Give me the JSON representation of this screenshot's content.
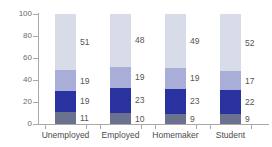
{
  "chart_data": {
    "type": "bar",
    "title": "",
    "subtitle": "",
    "xlabel": "",
    "ylabel": "",
    "ylim": [
      0,
      100
    ],
    "yticks": [
      0,
      20,
      40,
      60,
      80,
      100
    ],
    "grid": false,
    "legend": "none",
    "stacked": true,
    "stack_total": 100,
    "categories": [
      "Unemployed",
      "Employed",
      "Homemaker",
      "Student"
    ],
    "series": [
      {
        "name": "segment-1",
        "color": "#6a7290",
        "values": [
          11,
          10,
          9,
          9
        ]
      },
      {
        "name": "segment-2",
        "color": "#2a32a0",
        "values": [
          19,
          23,
          23,
          22
        ]
      },
      {
        "name": "segment-3",
        "color": "#a8aed8",
        "values": [
          19,
          19,
          19,
          17
        ]
      },
      {
        "name": "segment-4",
        "color": "#d8dce8",
        "values": [
          51,
          48,
          49,
          52
        ]
      }
    ]
  },
  "axis": {
    "tick_labels": [
      "0",
      "20",
      "40",
      "60",
      "80",
      "100"
    ]
  },
  "colors": {
    "segment_1": "#6a7290",
    "segment_2": "#2a32a0",
    "segment_3": "#a8aed8",
    "segment_4": "#d8dce8",
    "axis_line": "#a9a9a9",
    "label_text": "#4a4a4a",
    "tick_text": "#6b6b6b",
    "background": "#ffffff"
  }
}
